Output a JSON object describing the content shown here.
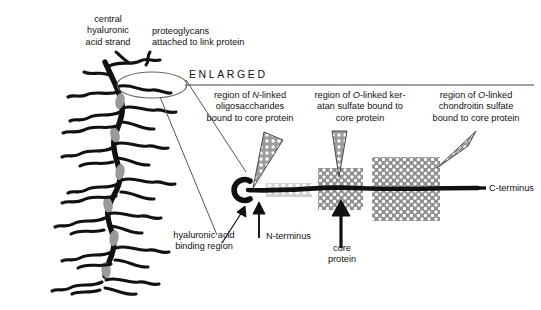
{
  "figure": {
    "type": "biology-diagram",
    "background_color": "#ffffff",
    "ink_color": "#111111",
    "link_protein_color": "#9a9a9a",
    "domain_fill_light": "#c9c9c9",
    "domain_fill_dark": "#8e8e8e"
  },
  "labels": {
    "central_strand": "central\nhyaluronic\nacid strand",
    "proteoglycans": "proteoglycans\nattached to link protein",
    "enlarged": "ENLARGED",
    "region_n_linked_pre": "region of ",
    "region_n_linked_italic": "N",
    "region_n_linked_post": "-linked\noligosaccharides\nbound to core protein",
    "region_keratan_pre": "region of ",
    "region_keratan_italic": "O",
    "region_keratan_post": "-linked ker-\natan sulfate bound to\ncore protein",
    "region_chondroitin_pre": "region of ",
    "region_chondroitin_italic": "O",
    "region_chondroitin_post": "-linked\nchondroitin sulfate\nbound to core protein",
    "ha_binding_region": "hyaluronic acid\nbinding region",
    "n_terminus": "N-terminus",
    "core_protein": "core\nprotein",
    "c_terminus": "C-terminus"
  },
  "domains": [
    {
      "name": "n-linked-oligosaccharide-domain",
      "x": 266,
      "y": 183,
      "w": 46,
      "h": 14,
      "fill": "#cfcfcf"
    },
    {
      "name": "keratan-sulfate-domain",
      "x": 318,
      "y": 168,
      "w": 45,
      "h": 42,
      "fill": "#8e8e8e"
    },
    {
      "name": "chondroitin-sulfate-domain",
      "x": 372,
      "y": 157,
      "w": 68,
      "h": 64,
      "fill": "#8e8e8e"
    }
  ],
  "pointers": [
    {
      "name": "pointer-n-linked",
      "tip_x": 253,
      "tip_y": 188
    },
    {
      "name": "pointer-keratan",
      "tip_x": 339,
      "tip_y": 177
    },
    {
      "name": "pointer-chondroitin",
      "tip_x": 437,
      "tip_y": 168
    }
  ]
}
